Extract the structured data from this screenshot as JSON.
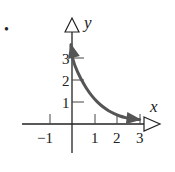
{
  "marker": "•",
  "chart_data": {
    "type": "line",
    "title": "",
    "xlabel": "x",
    "ylabel": "y",
    "xlim": [
      -1.5,
      3.5
    ],
    "ylim": [
      -1.3,
      4.3
    ],
    "grid": false,
    "x_ticks": [
      -1,
      1,
      2,
      3
    ],
    "x_tick_labels": [
      "−1",
      "1",
      "2",
      "3"
    ],
    "y_ticks": [
      1,
      2,
      3
    ],
    "y_tick_labels": [
      "1",
      "2",
      "3"
    ],
    "series": [
      {
        "name": "curve",
        "description": "decreasing exponential-like curve with arrowheads at both ends",
        "x": [
          -0.05,
          0,
          0.25,
          0.5,
          0.75,
          1.0,
          1.25,
          1.5,
          1.75,
          2.0,
          2.25,
          2.5,
          2.75,
          3.0
        ],
        "values": [
          3.6,
          3.0,
          2.35,
          1.85,
          1.45,
          1.13,
          0.88,
          0.68,
          0.53,
          0.41,
          0.32,
          0.26,
          0.22,
          0.2
        ],
        "color": "#555555"
      }
    ]
  }
}
